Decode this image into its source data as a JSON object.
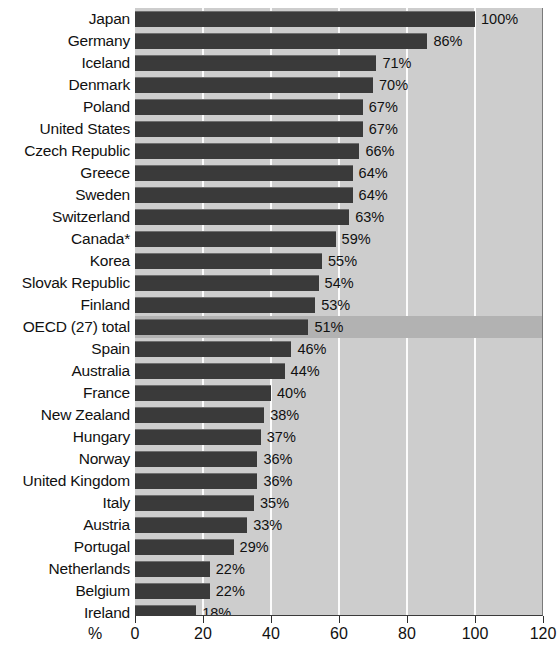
{
  "chart_data": {
    "type": "bar",
    "orientation": "horizontal",
    "title": "",
    "subtitle": "",
    "xlabel": "%",
    "ylabel": "",
    "xlim": [
      0,
      120
    ],
    "xticks": [
      0,
      20,
      40,
      60,
      80,
      100,
      120
    ],
    "xtick_labels": [
      "0",
      "20",
      "40",
      "60",
      "80",
      "100",
      "120"
    ],
    "grid": true,
    "grid_axis": "x",
    "legend": false,
    "value_label_suffix": "%",
    "highlight_category": "OECD (27) total",
    "categories": [
      "Japan",
      "Germany",
      "Iceland",
      "Denmark",
      "Poland",
      "United States",
      "Czech Republic",
      "Greece",
      "Sweden",
      "Switzerland",
      "Canada*",
      "Korea",
      "Slovak Republic",
      "Finland",
      "OECD (27) total",
      "Spain",
      "Australia",
      "France",
      "New Zealand",
      "Hungary",
      "Norway",
      "United Kingdom",
      "Italy",
      "Austria",
      "Portugal",
      "Netherlands",
      "Belgium",
      "Ireland"
    ],
    "values": [
      100,
      86,
      71,
      70,
      67,
      67,
      66,
      64,
      64,
      63,
      59,
      55,
      54,
      53,
      51,
      46,
      44,
      40,
      38,
      37,
      36,
      36,
      35,
      33,
      29,
      22,
      22,
      18
    ],
    "value_labels": [
      "100%",
      "86%",
      "71%",
      "70%",
      "67%",
      "67%",
      "66%",
      "64%",
      "64%",
      "63%",
      "59%",
      "55%",
      "54%",
      "53%",
      "51%",
      "46%",
      "44%",
      "40%",
      "38%",
      "37%",
      "36%",
      "36%",
      "35%",
      "33%",
      "29%",
      "22%",
      "22%",
      "18%"
    ]
  },
  "colors": {
    "bar": "#3a3a3a",
    "plot_background": "#cdcdcd",
    "highlight_row": "#b2b2b2",
    "gridline": "#fbfbfb",
    "text": "#111111",
    "page_background": "#ffffff"
  }
}
